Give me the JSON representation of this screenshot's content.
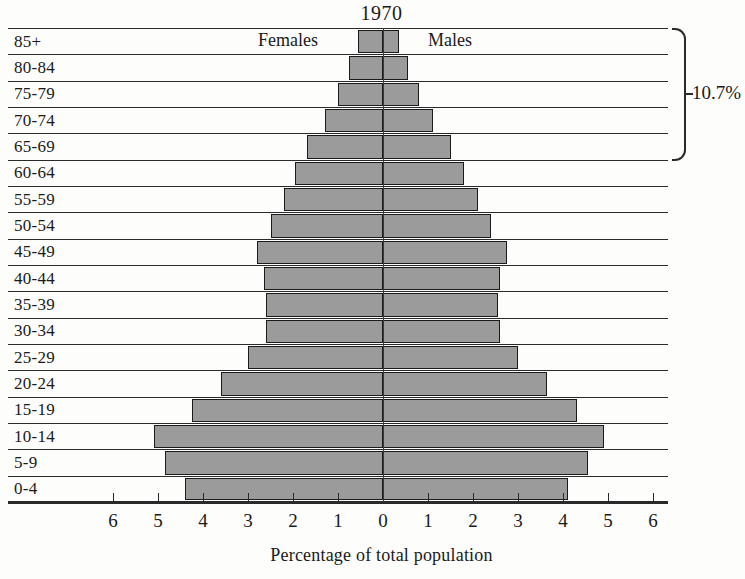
{
  "chart": {
    "title": "1970",
    "xaxis_title": "Percentage of total population",
    "left_series_label": "Females",
    "right_series_label": "Males",
    "annotation_label": "10.7%"
  },
  "chart_data": {
    "type": "bar",
    "subtype": "population-pyramid",
    "title": "1970",
    "xlabel": "Percentage of total population",
    "ylabel": "",
    "grid": false,
    "legend_position": "inline-top",
    "xlim": [
      -6.5,
      6.5
    ],
    "xticks": [
      6,
      5,
      4,
      3,
      2,
      1,
      0,
      1,
      2,
      3,
      4,
      5,
      6
    ],
    "categories": [
      "85+",
      "80-84",
      "75-79",
      "70-74",
      "65-69",
      "60-64",
      "55-59",
      "50-54",
      "45-49",
      "40-44",
      "35-39",
      "30-34",
      "25-29",
      "20-24",
      "15-19",
      "10-14",
      "5-9",
      "0-4"
    ],
    "series": [
      {
        "name": "Females",
        "side": "left",
        "values": [
          0.55,
          0.75,
          1.0,
          1.3,
          1.7,
          1.95,
          2.2,
          2.5,
          2.8,
          2.65,
          2.6,
          2.6,
          3.0,
          3.6,
          4.25,
          5.1,
          4.85,
          4.4
        ]
      },
      {
        "name": "Males",
        "side": "right",
        "values": [
          0.35,
          0.55,
          0.8,
          1.1,
          1.5,
          1.8,
          2.1,
          2.4,
          2.75,
          2.6,
          2.55,
          2.6,
          3.0,
          3.65,
          4.3,
          4.9,
          4.55,
          4.1
        ]
      }
    ],
    "annotations": [
      {
        "text": "10.7%",
        "covers_categories": [
          "85+",
          "80-84",
          "75-79",
          "70-74",
          "65-69"
        ],
        "position": "right-bracket"
      }
    ],
    "colors": {
      "bar_fill": "#9b9b9b",
      "bar_stroke": "#1b1b1b",
      "background": "#fdfdfb",
      "axis": "#2a2a2a"
    }
  },
  "xticks": [
    {
      "label": "6",
      "value": -6
    },
    {
      "label": "5",
      "value": -5
    },
    {
      "label": "4",
      "value": -4
    },
    {
      "label": "3",
      "value": -3
    },
    {
      "label": "2",
      "value": -2
    },
    {
      "label": "1",
      "value": -1
    },
    {
      "label": "0",
      "value": 0
    },
    {
      "label": "1",
      "value": 1
    },
    {
      "label": "2",
      "value": 2
    },
    {
      "label": "3",
      "value": 3
    },
    {
      "label": "4",
      "value": 4
    },
    {
      "label": "5",
      "value": 5
    },
    {
      "label": "6",
      "value": 6
    }
  ]
}
